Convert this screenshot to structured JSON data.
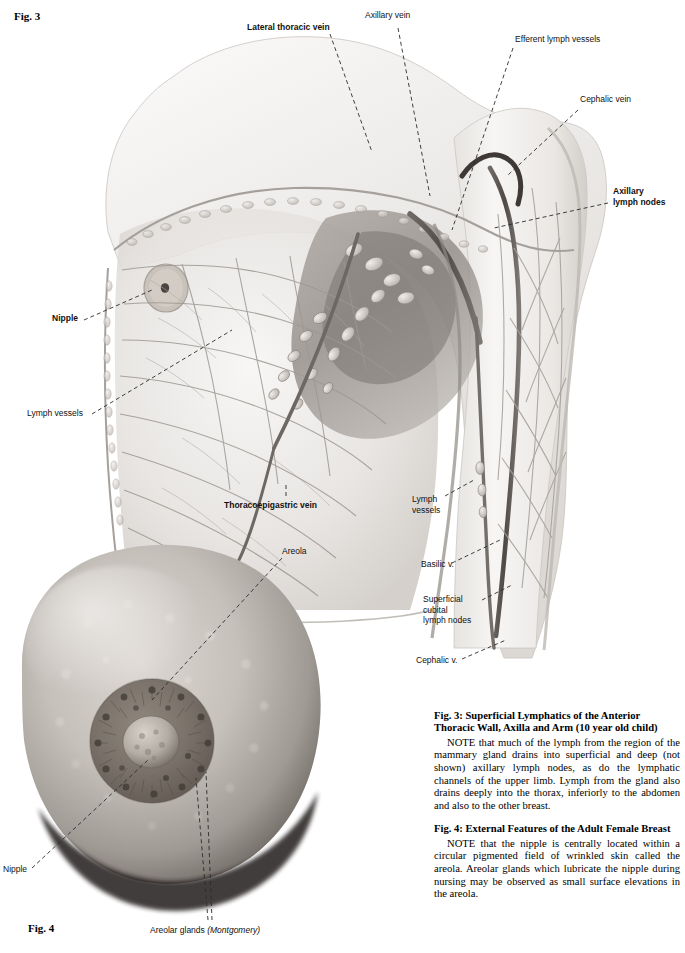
{
  "page": {
    "figure3_tag": "Fig. 3",
    "figure4_tag": "Fig. 4"
  },
  "figure3": {
    "title_tag": "Fig. 3",
    "labels": [
      {
        "id": "lateral-thoracic-vein",
        "text": "Lateral thoracic vein",
        "bold": true
      },
      {
        "id": "axillary-vein",
        "text": "Axillary vein",
        "bold": false
      },
      {
        "id": "efferent-lymph-vessels",
        "text": "Efferent lymph vessels",
        "bold": false
      },
      {
        "id": "cephalic-vein",
        "text": "Cephalic vein",
        "bold": false
      },
      {
        "id": "axillary-lymph-nodes",
        "text": "Axillary\nlymph nodes",
        "bold": true
      },
      {
        "id": "nipple",
        "text": "Nipple",
        "bold": true
      },
      {
        "id": "lymph-vessels-left",
        "text": "Lymph vessels",
        "bold": false
      },
      {
        "id": "thoracoepigastric-vein",
        "text": "Thoracoepigastric vein",
        "bold": true
      },
      {
        "id": "lymph-vessels-arm",
        "text": "Lymph\nvessels",
        "bold": false
      },
      {
        "id": "basilic-vein",
        "text": "Basilic v.",
        "bold": false
      },
      {
        "id": "superficial-cubital-lymph-nodes",
        "text": "Superficial\ncubital\nlymph nodes",
        "bold": false
      },
      {
        "id": "cephalic-vein-lower",
        "text": "Cephalic v.",
        "bold": false
      }
    ]
  },
  "figure4": {
    "title_tag": "Fig. 4",
    "labels": [
      {
        "id": "areola",
        "text": "Areola",
        "bold": false
      },
      {
        "id": "nipple",
        "text": "Nipple",
        "bold": false
      },
      {
        "id": "areolar-glands",
        "text": "Areolar glands ",
        "italic_part": "(Montgomery)",
        "bold": false
      }
    ]
  },
  "captions": {
    "fig3_heading": "Fig. 3:  Superficial Lymphatics of the Anterior Thoracic Wall, Axilla and Arm (10 year old child)",
    "fig3_note": "NOTE that much of the lymph from the region of the mammary gland drains into superficial and deep (not shown) axillary lymph nodes, as do the lymphatic channels of the upper limb. Lymph from the gland also drains deeply into the thorax, inferiorly to the abdomen and also to the other breast.",
    "fig4_heading": "Fig. 4:  External Features of the Adult Female Breast",
    "fig4_note": "NOTE that the nipple is centrally located within a circular pigmented field of wrinkled skin called the areola. Areolar glands which lubricate the nipple during nursing may be observed as small surface elevations in the areola."
  },
  "colors": {
    "ink": "#111111",
    "leader": "#2b2b2b",
    "skin_light": "#f2f0ee",
    "skin_mid": "#d9d5d1",
    "skin_dark": "#b4afaa",
    "vessel": "#8a8682",
    "node": "#cfc9c4",
    "photo_dark": "#2a2522"
  }
}
